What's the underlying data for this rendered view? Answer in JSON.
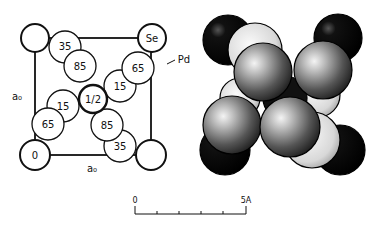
{
  "left_diagram": {
    "corner_labels": {
      "top_right": "Se",
      "bottom_left": "0"
    },
    "atom_label": "Pd",
    "axis_labels": {
      "left": "a₀",
      "bottom": "a₀"
    },
    "center_label": "1/2",
    "circles": [
      {
        "label": "35",
        "pos": "upper-left"
      },
      {
        "label": "85",
        "pos": "upper-left-inner"
      },
      {
        "label": "65",
        "pos": "upper-right"
      },
      {
        "label": "15",
        "pos": "upper-right-inner"
      },
      {
        "label": "15",
        "pos": "lower-left-inner"
      },
      {
        "label": "65",
        "pos": "lower-left"
      },
      {
        "label": "85",
        "pos": "lower-right-inner"
      },
      {
        "label": "35",
        "pos": "lower-right"
      }
    ]
  },
  "right_diagram": {
    "description": "space-filling model of PdSe structure"
  },
  "scale_bar": {
    "start_label": "0",
    "end_label": "5A",
    "ticks": 6
  }
}
